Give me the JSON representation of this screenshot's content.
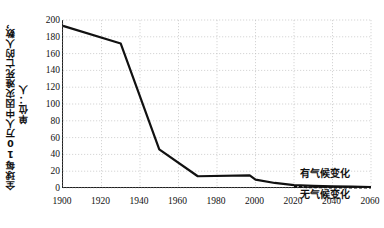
{
  "chart_data": {
    "type": "line",
    "title": "",
    "xlabel": "",
    "ylabel": "全球每10万人中因灾难死亡的人数，单位：人",
    "ylabel_line1": "全球每10万人中因灾难死亡的人数，",
    "ylabel_line2": "单位：人",
    "xlim": [
      1900,
      2060
    ],
    "ylim": [
      0,
      200
    ],
    "xticks": [
      "1900",
      "1920",
      "1940",
      "1960",
      "1980",
      "2000",
      "2020",
      "2040",
      "2060"
    ],
    "yticks": [
      "200",
      "180",
      "160",
      "140",
      "120",
      "100",
      "80",
      "60",
      "40",
      "20",
      "0"
    ],
    "grid": true,
    "legend_position": "inline-right",
    "series": [
      {
        "name": "有气候变化",
        "style": "solid",
        "color": "#111111",
        "x": [
          1900,
          1930,
          1950,
          1970,
          1997,
          2000,
          2010,
          2020,
          2030,
          2040,
          2050,
          2060
        ],
        "values": [
          193,
          172,
          46,
          14,
          15,
          10,
          6,
          3.5,
          2.5,
          2,
          1.6,
          1.2
        ]
      },
      {
        "name": "无气候变化",
        "style": "dashed",
        "color": "#111111",
        "x": [
          2020,
          2030,
          2040,
          2050,
          2060
        ],
        "values": [
          1.2,
          0.9,
          0.7,
          0.6,
          0.5
        ]
      }
    ],
    "annotations": [
      {
        "text": "有气候变化",
        "position": "upper-right-inline"
      },
      {
        "text": "无气候变化",
        "position": "lower-right-inline"
      }
    ]
  }
}
